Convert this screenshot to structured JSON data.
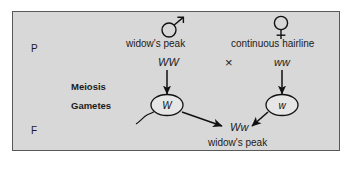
{
  "diagram": {
    "panel": {
      "background_color": "#d8d8d8",
      "border_color": "#5a5a5a"
    },
    "generation_labels": {
      "parental": "P",
      "filial": "F"
    },
    "process_labels": {
      "meiosis": "Meiosis",
      "gametes": "Gametes"
    },
    "cross_symbol": "×",
    "parents": [
      {
        "sex": "male",
        "sex_symbol": "♂",
        "sex_symbol_name": "male-symbol",
        "phenotype": "widow's peak",
        "genotype": "WW",
        "gamete_allele": "W"
      },
      {
        "sex": "female",
        "sex_symbol": "♀",
        "sex_symbol_name": "female-symbol",
        "phenotype": "continuous hairline",
        "genotype": "ww",
        "gamete_allele": "w"
      }
    ],
    "offspring": {
      "genotype": "Ww",
      "phenotype": "widow's peak"
    }
  }
}
